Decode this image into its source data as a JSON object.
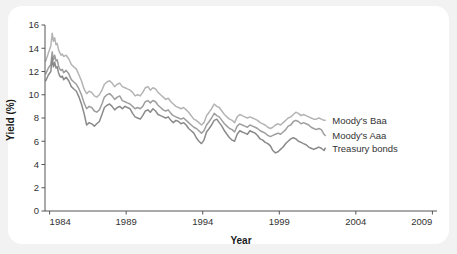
{
  "chart_data": {
    "type": "line",
    "title": "",
    "xlabel": "Year",
    "ylabel": "Yield (%)",
    "xlim": [
      1983.7,
      2009.3
    ],
    "ylim": [
      0,
      16
    ],
    "xticks": [
      1984,
      1989,
      1994,
      1999,
      2004,
      2009
    ],
    "xtick_labels": [
      "1984",
      "1989",
      "1994",
      "1999",
      "2004",
      "2009"
    ],
    "yticks": [
      0,
      2,
      4,
      6,
      8,
      10,
      12,
      14,
      16
    ],
    "ytick_labels": [
      "0",
      "2",
      "4",
      "6",
      "8",
      "10",
      "12",
      "14",
      "16"
    ],
    "grid": false,
    "legend_position": "right-inline-at-series-end",
    "data_x_range": [
      1983.75,
      2002.0
    ],
    "series": [
      {
        "name": "Moody's Baa",
        "label": "Moody's Baa",
        "color": "#b4b4b4",
        "x": [
          1983.75,
          1983.92,
          1984.08,
          1984.17,
          1984.25,
          1984.33,
          1984.42,
          1984.5,
          1984.58,
          1984.67,
          1984.75,
          1984.83,
          1984.92,
          1985.08,
          1985.25,
          1985.42,
          1985.58,
          1985.75,
          1985.92,
          1986.08,
          1986.25,
          1986.42,
          1986.58,
          1986.75,
          1986.92,
          1987.08,
          1987.25,
          1987.42,
          1987.58,
          1987.75,
          1987.92,
          1988.08,
          1988.25,
          1988.42,
          1988.58,
          1988.75,
          1988.92,
          1989.08,
          1989.25,
          1989.42,
          1989.58,
          1989.75,
          1989.92,
          1990.08,
          1990.25,
          1990.42,
          1990.58,
          1990.75,
          1990.92,
          1991.08,
          1991.25,
          1991.42,
          1991.58,
          1991.75,
          1991.92,
          1992.08,
          1992.25,
          1992.42,
          1992.58,
          1992.75,
          1992.92,
          1993.08,
          1993.25,
          1993.42,
          1993.58,
          1993.75,
          1993.92,
          1994.08,
          1994.25,
          1994.42,
          1994.58,
          1994.75,
          1994.92,
          1995.08,
          1995.25,
          1995.42,
          1995.58,
          1995.75,
          1995.92,
          1996.08,
          1996.25,
          1996.42,
          1996.58,
          1996.75,
          1996.92,
          1997.08,
          1997.25,
          1997.42,
          1997.58,
          1997.75,
          1997.92,
          1998.08,
          1998.25,
          1998.42,
          1998.58,
          1998.75,
          1998.92,
          1999.08,
          1999.25,
          1999.42,
          1999.58,
          1999.75,
          1999.92,
          2000.08,
          2000.25,
          2000.42,
          2000.58,
          2000.75,
          2000.92,
          2001.08,
          2001.25,
          2001.42,
          2001.58,
          2001.75,
          2001.92,
          2002.0
        ],
        "values": [
          12.9,
          13.6,
          14.2,
          15.3,
          14.6,
          14.9,
          14.3,
          14.4,
          13.9,
          13.6,
          13.4,
          13.5,
          13.3,
          13.4,
          13.1,
          12.6,
          12.4,
          12.2,
          11.7,
          11.2,
          10.5,
          10.1,
          10.3,
          10.2,
          9.9,
          9.8,
          10.0,
          10.4,
          10.9,
          11.1,
          11.2,
          11.0,
          10.7,
          10.9,
          11.0,
          10.7,
          10.6,
          10.5,
          10.4,
          10.2,
          9.9,
          10.0,
          9.9,
          10.2,
          10.6,
          10.7,
          10.4,
          10.6,
          10.5,
          10.2,
          10.0,
          9.8,
          9.6,
          9.7,
          9.4,
          9.2,
          9.0,
          8.9,
          8.8,
          8.9,
          8.7,
          8.5,
          8.2,
          7.9,
          7.8,
          7.6,
          7.4,
          7.6,
          8.2,
          8.5,
          8.8,
          9.2,
          9.0,
          8.9,
          8.6,
          8.3,
          8.1,
          7.9,
          7.8,
          7.6,
          8.1,
          8.3,
          8.2,
          8.1,
          8.0,
          8.1,
          8.0,
          7.9,
          7.8,
          7.6,
          7.5,
          7.4,
          7.2,
          7.1,
          7.2,
          7.4,
          7.5,
          7.4,
          7.6,
          7.8,
          8.0,
          8.1,
          8.3,
          8.5,
          8.4,
          8.2,
          8.3,
          8.2,
          8.1,
          8.0,
          7.9,
          7.9,
          8.0,
          7.9,
          7.8,
          7.8
        ]
      },
      {
        "name": "Moody's Aaa",
        "label": "Moody's Aaa",
        "color": "#9e9e9e",
        "x": [
          1983.75,
          1983.92,
          1984.08,
          1984.17,
          1984.25,
          1984.33,
          1984.42,
          1984.5,
          1984.58,
          1984.67,
          1984.75,
          1984.83,
          1984.92,
          1985.08,
          1985.25,
          1985.42,
          1985.58,
          1985.75,
          1985.92,
          1986.08,
          1986.25,
          1986.42,
          1986.58,
          1986.75,
          1986.92,
          1987.08,
          1987.25,
          1987.42,
          1987.58,
          1987.75,
          1987.92,
          1988.08,
          1988.25,
          1988.42,
          1988.58,
          1988.75,
          1988.92,
          1989.08,
          1989.25,
          1989.42,
          1989.58,
          1989.75,
          1989.92,
          1990.08,
          1990.25,
          1990.42,
          1990.58,
          1990.75,
          1990.92,
          1991.08,
          1991.25,
          1991.42,
          1991.58,
          1991.75,
          1991.92,
          1992.08,
          1992.25,
          1992.42,
          1992.58,
          1992.75,
          1992.92,
          1993.08,
          1993.25,
          1993.42,
          1993.58,
          1993.75,
          1993.92,
          1994.08,
          1994.25,
          1994.42,
          1994.58,
          1994.75,
          1994.92,
          1995.08,
          1995.25,
          1995.42,
          1995.58,
          1995.75,
          1995.92,
          1996.08,
          1996.25,
          1996.42,
          1996.58,
          1996.75,
          1996.92,
          1997.08,
          1997.25,
          1997.42,
          1997.58,
          1997.75,
          1997.92,
          1998.08,
          1998.25,
          1998.42,
          1998.58,
          1998.75,
          1998.92,
          1999.08,
          1999.25,
          1999.42,
          1999.58,
          1999.75,
          1999.92,
          2000.08,
          2000.25,
          2000.42,
          2000.58,
          2000.75,
          2000.92,
          2001.08,
          2001.25,
          2001.42,
          2001.58,
          2001.75,
          2001.92,
          2002.0
        ],
        "values": [
          11.8,
          12.3,
          12.6,
          13.7,
          13.0,
          13.4,
          12.9,
          13.0,
          12.5,
          12.2,
          12.1,
          12.2,
          11.9,
          12.1,
          11.8,
          11.3,
          11.1,
          10.9,
          10.5,
          10.0,
          9.3,
          8.8,
          9.0,
          8.9,
          8.6,
          8.5,
          8.7,
          9.2,
          9.8,
          10.0,
          10.1,
          9.9,
          9.6,
          9.8,
          9.9,
          9.5,
          9.4,
          9.3,
          9.2,
          9.0,
          8.8,
          8.9,
          8.8,
          9.0,
          9.4,
          9.5,
          9.3,
          9.5,
          9.4,
          9.1,
          8.9,
          8.7,
          8.6,
          8.7,
          8.4,
          8.2,
          8.1,
          8.0,
          7.9,
          8.0,
          7.8,
          7.6,
          7.4,
          7.2,
          7.1,
          6.9,
          6.7,
          6.9,
          7.4,
          7.7,
          8.0,
          8.4,
          8.2,
          8.1,
          7.8,
          7.5,
          7.3,
          7.1,
          7.0,
          6.8,
          7.3,
          7.5,
          7.4,
          7.3,
          7.2,
          7.4,
          7.3,
          7.2,
          7.1,
          6.9,
          6.8,
          6.7,
          6.5,
          6.4,
          6.5,
          6.6,
          6.7,
          6.6,
          6.8,
          7.0,
          7.3,
          7.4,
          7.7,
          7.8,
          7.7,
          7.5,
          7.6,
          7.5,
          7.4,
          7.2,
          7.1,
          7.0,
          7.1,
          7.0,
          6.6,
          6.5
        ]
      },
      {
        "name": "Treasury bonds",
        "label": "Treasury bonds",
        "color": "#8a8a8a",
        "x": [
          1983.75,
          1983.92,
          1984.08,
          1984.17,
          1984.25,
          1984.33,
          1984.42,
          1984.5,
          1984.58,
          1984.67,
          1984.75,
          1984.83,
          1984.92,
          1985.08,
          1985.25,
          1985.42,
          1985.58,
          1985.75,
          1985.92,
          1986.08,
          1986.25,
          1986.42,
          1986.58,
          1986.75,
          1986.92,
          1987.08,
          1987.25,
          1987.42,
          1987.58,
          1987.75,
          1987.92,
          1988.08,
          1988.25,
          1988.42,
          1988.58,
          1988.75,
          1988.92,
          1989.08,
          1989.25,
          1989.42,
          1989.58,
          1989.75,
          1989.92,
          1990.08,
          1990.25,
          1990.42,
          1990.58,
          1990.75,
          1990.92,
          1991.08,
          1991.25,
          1991.42,
          1991.58,
          1991.75,
          1991.92,
          1992.08,
          1992.25,
          1992.42,
          1992.58,
          1992.75,
          1992.92,
          1993.08,
          1993.25,
          1993.42,
          1993.58,
          1993.75,
          1993.92,
          1994.08,
          1994.25,
          1994.42,
          1994.58,
          1994.75,
          1994.92,
          1995.08,
          1995.25,
          1995.42,
          1995.58,
          1995.75,
          1995.92,
          1996.08,
          1996.25,
          1996.42,
          1996.58,
          1996.75,
          1996.92,
          1997.08,
          1997.25,
          1997.42,
          1997.58,
          1997.75,
          1997.92,
          1998.08,
          1998.25,
          1998.42,
          1998.58,
          1998.75,
          1998.92,
          1999.08,
          1999.25,
          1999.42,
          1999.58,
          1999.75,
          1999.92,
          2000.08,
          2000.25,
          2000.42,
          2000.58,
          2000.75,
          2000.92,
          2001.08,
          2001.25,
          2001.42,
          2001.58,
          2001.75,
          2001.92,
          2002.0
        ],
        "values": [
          11.2,
          11.7,
          12.0,
          13.2,
          12.4,
          12.8,
          12.3,
          12.4,
          11.9,
          11.6,
          11.5,
          11.6,
          11.3,
          11.5,
          11.2,
          10.7,
          10.5,
          10.3,
          9.8,
          9.2,
          8.4,
          7.4,
          7.6,
          7.5,
          7.3,
          7.5,
          7.7,
          8.3,
          8.9,
          9.1,
          9.2,
          9.0,
          8.7,
          8.9,
          9.0,
          8.8,
          9.0,
          8.9,
          8.8,
          8.4,
          8.1,
          8.0,
          7.9,
          8.2,
          8.6,
          8.7,
          8.5,
          8.8,
          8.6,
          8.3,
          8.2,
          8.1,
          8.0,
          8.1,
          7.8,
          7.6,
          7.8,
          7.7,
          7.5,
          7.6,
          7.4,
          7.1,
          6.9,
          6.7,
          6.3,
          6.0,
          5.8,
          6.1,
          6.8,
          7.1,
          7.4,
          7.8,
          7.9,
          7.6,
          7.3,
          6.9,
          6.6,
          6.3,
          6.1,
          6.0,
          6.6,
          6.9,
          6.8,
          6.7,
          6.6,
          6.9,
          6.8,
          6.7,
          6.5,
          6.2,
          6.1,
          5.9,
          5.8,
          5.6,
          5.2,
          5.0,
          5.1,
          5.3,
          5.5,
          5.8,
          6.0,
          6.2,
          6.3,
          6.2,
          6.0,
          5.9,
          5.8,
          5.7,
          5.5,
          5.4,
          5.3,
          5.4,
          5.5,
          5.4,
          5.2,
          5.4
        ]
      }
    ],
    "annotations": [
      {
        "text": "Moody's Baa",
        "at_year": 2002.0,
        "at_value": 7.8
      },
      {
        "text": "Moody's Aaa",
        "at_year": 2002.0,
        "at_value": 6.5
      },
      {
        "text": "Treasury bonds",
        "at_year": 2002.0,
        "at_value": 5.4
      }
    ]
  },
  "theme": {
    "page_background": "#f2f2f2",
    "card_background": "#ffffff",
    "axis_color": "#555555",
    "text_color": "#333333"
  }
}
